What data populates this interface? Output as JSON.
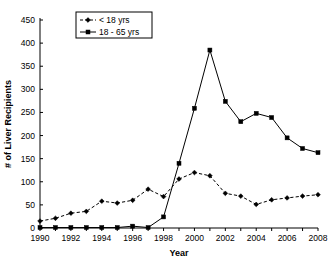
{
  "chart_data": {
    "type": "line",
    "title": "",
    "xlabel": "Year",
    "ylabel": "# of Liver Recipients",
    "x": [
      1990,
      1991,
      1992,
      1993,
      1994,
      1995,
      1996,
      1997,
      1998,
      1999,
      2000,
      2001,
      2002,
      2003,
      2004,
      2005,
      2006,
      2007,
      2008
    ],
    "xlim": [
      1990,
      2008
    ],
    "ylim": [
      0,
      450
    ],
    "ytick_labels": [
      "0",
      "50",
      "100",
      "150",
      "200",
      "250",
      "300",
      "350",
      "400",
      "450"
    ],
    "yticks": [
      0,
      50,
      100,
      150,
      200,
      250,
      300,
      350,
      400,
      450
    ],
    "xtick_labels": [
      "1990",
      "1992",
      "1994",
      "1996",
      "1998",
      "2000",
      "2002",
      "2004",
      "2006",
      "2008"
    ],
    "xticks": [
      1990,
      1992,
      1994,
      1996,
      1998,
      2000,
      2002,
      2004,
      2006,
      2008
    ],
    "grid": false,
    "legend_position": "top-left",
    "series": [
      {
        "name": "< 18 yrs",
        "marker": "diamond",
        "linestyle": "dashed",
        "color": "#000000",
        "values": [
          15,
          21,
          32,
          36,
          58,
          54,
          60,
          84,
          68,
          106,
          120,
          113,
          75,
          69,
          51,
          61,
          65,
          69,
          72
        ]
      },
      {
        "name": "18 - 65 yrs",
        "marker": "square",
        "linestyle": "solid",
        "color": "#000000",
        "values": [
          1,
          1,
          1,
          1,
          1,
          1,
          4,
          1,
          24,
          140,
          259,
          385,
          274,
          230,
          248,
          239,
          195,
          172,
          163
        ]
      }
    ]
  },
  "legend": {
    "entries": [
      {
        "label": "< 18 yrs"
      },
      {
        "label": "18 - 65 yrs"
      }
    ]
  }
}
